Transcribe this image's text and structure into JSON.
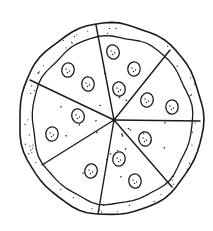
{
  "image": {
    "subject": "Hand-drawn line sketch of a whole pizza cut into slices with pepperoni",
    "style": "black ink line art on white",
    "ink_color": "#1a1a1a",
    "background_color": "#ffffff"
  },
  "pizza": {
    "slice_count": 7,
    "center": [
      114,
      120
    ],
    "outer_rim": {
      "cx": 111,
      "cy": 119,
      "rx": 92,
      "ry": 96
    },
    "inner_crust": {
      "cx": 112,
      "cy": 120,
      "rx": 80,
      "ry": 84
    },
    "cut_endpoints": [
      [
        96,
        25
      ],
      [
        170,
        50
      ],
      [
        200,
        121
      ],
      [
        172,
        187
      ],
      [
        98,
        214
      ],
      [
        42,
        165
      ],
      [
        30,
        80
      ]
    ],
    "pepperoni": [
      [
        113,
        52
      ],
      [
        134,
        69
      ],
      [
        119,
        89
      ],
      [
        68,
        70
      ],
      [
        88,
        84
      ],
      [
        147,
        100
      ],
      [
        172,
        107
      ],
      [
        78,
        116
      ],
      [
        52,
        134
      ],
      [
        145,
        139
      ],
      [
        119,
        159
      ],
      [
        135,
        181
      ],
      [
        91,
        171
      ]
    ]
  }
}
